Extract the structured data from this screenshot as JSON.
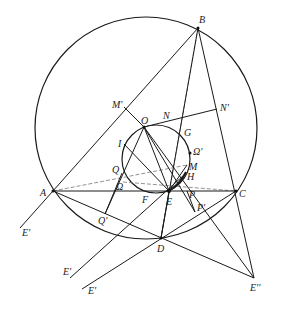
{
  "diagram": {
    "circles": [
      {
        "name": "circumcircle",
        "cx": 146,
        "cy": 128,
        "r": 111
      },
      {
        "name": "inner-circle",
        "cx": 156,
        "cy": 159,
        "r": 34
      }
    ],
    "points": {
      "A": {
        "x": 53,
        "y": 191,
        "label": "A"
      },
      "B": {
        "x": 198,
        "y": 28,
        "label": "B"
      },
      "C": {
        "x": 236,
        "y": 191,
        "label": "C"
      },
      "D": {
        "x": 161,
        "y": 238,
        "label": "D"
      },
      "E": {
        "x": 169,
        "y": 191,
        "label": "E"
      },
      "F": {
        "x": 143,
        "y": 193,
        "label": "F"
      },
      "G": {
        "x": 182,
        "y": 131,
        "label": "G"
      },
      "H": {
        "x": 184,
        "y": 175,
        "label": "H"
      },
      "I": {
        "x": 124,
        "y": 144,
        "label": "I"
      },
      "M": {
        "x": 187,
        "y": 165,
        "label": "M"
      },
      "M_prime": {
        "x": 124,
        "y": 107,
        "label": "M'"
      },
      "N": {
        "x": 160,
        "y": 121,
        "label": "N"
      },
      "N_prime": {
        "x": 217,
        "y": 109,
        "label": "N'"
      },
      "O": {
        "x": 144,
        "y": 127,
        "label": "O"
      },
      "P": {
        "x": 187,
        "y": 191,
        "label": "P"
      },
      "P_prime": {
        "x": 195,
        "y": 212,
        "label": "P'"
      },
      "Q": {
        "x": 122,
        "y": 173,
        "label": "Q"
      },
      "Q_prime": {
        "x": 105,
        "y": 214,
        "label": "Q'"
      },
      "Omega": {
        "x": 123,
        "y": 182,
        "label": "Ω"
      },
      "Omega_prime": {
        "x": 190,
        "y": 153,
        "label": "Ω'"
      },
      "E_prime_1": {
        "x": 20,
        "y": 228,
        "label": "E'"
      },
      "E_prime_2": {
        "x": 70,
        "y": 278,
        "label": "E'"
      },
      "E_prime_3": {
        "x": 82,
        "y": 289,
        "label": "E'"
      },
      "E_double_prime": {
        "x": 254,
        "y": 278,
        "label": "E''"
      }
    }
  }
}
